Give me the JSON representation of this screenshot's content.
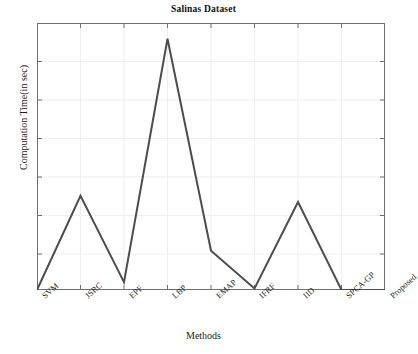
{
  "chart_data": {
    "type": "line",
    "title": "Salinas Dataset",
    "xlabel": "Methods",
    "ylabel": "Computation Time(in sec)",
    "categories": [
      "SVM",
      "JSRC",
      "EPF",
      "LBP",
      "EMAP",
      "IFRF",
      "IID",
      "SPCA-GP",
      "Proposed"
    ],
    "values": [
      0,
      3.0,
      0.25,
      8.0,
      1.25,
      0.05,
      2.8,
      0.0,
      0.0
    ],
    "series": [
      {
        "name": "Computation Time",
        "values": [
          0,
          3.0,
          0.25,
          8.0,
          1.25,
          0.05,
          2.8,
          0.0,
          0.0
        ]
      }
    ],
    "ylim": [
      0,
      8.5
    ],
    "xlim": [
      0,
      8
    ],
    "yticks_labeled": false,
    "ytick_count": 8,
    "grid": true,
    "legend": "none",
    "line_color": "#4d4d4d",
    "line_width": 2,
    "axis_color": "#6f6f6f",
    "grid_color": "#eeeeee",
    "background": "#ffffff"
  },
  "figure": {
    "title": "Salinas Dataset",
    "x_axis_title": "Methods",
    "y_axis_title": "Computation Time(in sec)",
    "tick_labels": {
      "t0": "SVM",
      "t1": "JSRC",
      "t2": "EPF",
      "t3": "LBP",
      "t4": "EMAP",
      "t5": "IFRF",
      "t6": "IID",
      "t7": "SPCA-GP",
      "t8": "Proposed"
    }
  }
}
